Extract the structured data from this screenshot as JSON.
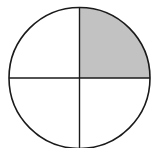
{
  "diagram": {
    "type": "fraction-circle",
    "total_parts": 4,
    "shaded_parts": 1,
    "shaded_quadrants": [
      "top-right"
    ],
    "fraction": "1/4",
    "colors": {
      "shaded": "#c2c2c2",
      "unshaded": "#ffffff",
      "stroke": "#1a1a1a"
    }
  }
}
